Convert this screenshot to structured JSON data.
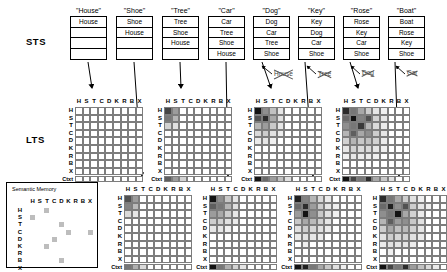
{
  "figure": {
    "sts_label": "STS",
    "lts_label": "LTS",
    "semantic_memory_title": "Semantic Memory",
    "context_row_label": "Ctxt",
    "item_labels": [
      "H",
      "S",
      "T",
      "C",
      "D",
      "K",
      "R",
      "B",
      "X"
    ]
  },
  "sts_columns": [
    {
      "cue": "\"House\"",
      "items": [
        "House",
        "",
        "",
        ""
      ]
    },
    {
      "cue": "\"Shoe\"",
      "items": [
        "Shoe",
        "House",
        "",
        ""
      ]
    },
    {
      "cue": "\"Tree\"",
      "items": [
        "Tree",
        "Shoe",
        "House",
        ""
      ]
    },
    {
      "cue": "\"Car\"",
      "items": [
        "Car",
        "Tree",
        "Shoe",
        "House"
      ]
    },
    {
      "cue": "\"Dog\"",
      "items": [
        "Dog",
        "Car",
        "Tree",
        "Shoe"
      ]
    },
    {
      "cue": "\"Key\"",
      "items": [
        "Key",
        "Dog",
        "Car",
        "Shoe"
      ]
    },
    {
      "cue": "\"Rose\"",
      "items": [
        "Rose",
        "Key",
        "Car",
        "Shoe"
      ]
    },
    {
      "cue": "\"Boat\"",
      "items": [
        "Boat",
        "Rose",
        "Key",
        "Shoe"
      ]
    }
  ],
  "dropped_words": [
    {
      "text": "House"
    },
    {
      "text": "Tree"
    },
    {
      "text": "Dog"
    },
    {
      "text": "Car"
    }
  ],
  "chart_data": {
    "type": "heatmap",
    "xlabel": "",
    "ylabel": "",
    "categories": [
      "H",
      "S",
      "T",
      "C",
      "D",
      "K",
      "R",
      "B",
      "X"
    ],
    "row_categories": [
      "H",
      "S",
      "T",
      "C",
      "D",
      "K",
      "R",
      "B",
      "X",
      "Ctxt"
    ],
    "scale": "0 = white (no association) to 1 = black (strong association)",
    "grid": true,
    "legend": "none",
    "matrices": [
      {
        "name": "lts-matrix-1",
        "source_trial": "\"House\"",
        "position": "top-row-1",
        "values": [
          [
            0,
            0,
            0,
            0,
            0,
            0,
            0,
            0,
            0
          ],
          [
            0,
            0,
            0,
            0,
            0,
            0,
            0,
            0,
            0
          ],
          [
            0,
            0,
            0,
            0,
            0,
            0,
            0,
            0,
            0
          ],
          [
            0,
            0,
            0,
            0,
            0,
            0,
            0,
            0,
            0
          ],
          [
            0,
            0,
            0,
            0,
            0,
            0,
            0,
            0,
            0
          ],
          [
            0,
            0,
            0,
            0,
            0,
            0,
            0,
            0,
            0
          ],
          [
            0,
            0,
            0,
            0,
            0,
            0,
            0,
            0,
            0
          ],
          [
            0,
            0,
            0,
            0,
            0,
            0,
            0,
            0,
            0
          ],
          [
            0,
            0,
            0,
            0,
            0,
            0,
            0,
            0,
            0
          ]
        ],
        "context": [
          0,
          0,
          0,
          0,
          0,
          0,
          0,
          0,
          0
        ]
      },
      {
        "name": "lts-matrix-2",
        "source_trial": "\"Tree\"",
        "position": "top-row-2",
        "values": [
          [
            0.75,
            0.4,
            0,
            0,
            0,
            0,
            0,
            0,
            0
          ],
          [
            0.55,
            0.3,
            0,
            0,
            0,
            0,
            0,
            0,
            0
          ],
          [
            0.18,
            0.12,
            0,
            0,
            0,
            0,
            0,
            0,
            0
          ],
          [
            0,
            0,
            0,
            0,
            0,
            0,
            0,
            0,
            0
          ],
          [
            0,
            0,
            0,
            0,
            0,
            0,
            0,
            0,
            0
          ],
          [
            0,
            0,
            0,
            0,
            0,
            0,
            0,
            0,
            0
          ],
          [
            0,
            0,
            0,
            0,
            0,
            0,
            0,
            0,
            0
          ],
          [
            0,
            0,
            0,
            0,
            0,
            0,
            0,
            0,
            0
          ],
          [
            0,
            0,
            0,
            0,
            0,
            0,
            0,
            0,
            0
          ]
        ],
        "context": [
          0.65,
          0.4,
          0.18,
          0,
          0,
          0,
          0,
          0,
          0
        ]
      },
      {
        "name": "lts-matrix-3",
        "source_trial": "\"Dog\"",
        "position": "top-row-3",
        "values": [
          [
            0.95,
            0.45,
            0.25,
            0.1,
            0,
            0,
            0,
            0,
            0
          ],
          [
            0.7,
            0.85,
            0.35,
            0.12,
            0,
            0,
            0,
            0,
            0
          ],
          [
            0.3,
            0.4,
            0.22,
            0.1,
            0,
            0,
            0,
            0,
            0
          ],
          [
            0.15,
            0.2,
            0.12,
            0.08,
            0,
            0,
            0,
            0,
            0
          ],
          [
            0.08,
            0.1,
            0.06,
            0,
            0,
            0,
            0,
            0,
            0
          ],
          [
            0,
            0,
            0,
            0,
            0,
            0,
            0,
            0,
            0
          ],
          [
            0,
            0,
            0,
            0,
            0,
            0,
            0,
            0,
            0
          ],
          [
            0,
            0,
            0,
            0,
            0,
            0,
            0,
            0,
            0
          ],
          [
            0,
            0,
            0,
            0,
            0,
            0,
            0,
            0,
            0
          ]
        ],
        "context": [
          0.95,
          0.6,
          0.4,
          0.25,
          0.12,
          0,
          0,
          0,
          0
        ]
      },
      {
        "name": "lts-matrix-4",
        "source_trial": "\"Rose\"",
        "position": "top-row-4",
        "values": [
          [
            0.85,
            0.55,
            0.35,
            0.2,
            0.1,
            0.06,
            0,
            0,
            0
          ],
          [
            0.6,
            0.95,
            0.5,
            0.7,
            0.18,
            0.1,
            0,
            0,
            0
          ],
          [
            0.45,
            0.55,
            0.8,
            0.3,
            0.15,
            0.08,
            0,
            0,
            0
          ],
          [
            0.3,
            0.65,
            0.35,
            0.45,
            0.2,
            0.1,
            0,
            0,
            0
          ],
          [
            0.18,
            0.3,
            0.22,
            0.25,
            0.18,
            0.08,
            0,
            0,
            0
          ],
          [
            0.1,
            0.18,
            0.14,
            0.15,
            0.1,
            0.06,
            0,
            0,
            0
          ],
          [
            0.06,
            0.1,
            0.08,
            0.08,
            0.06,
            0,
            0,
            0,
            0
          ],
          [
            0,
            0,
            0,
            0,
            0,
            0,
            0,
            0,
            0
          ],
          [
            0,
            0,
            0,
            0,
            0,
            0,
            0,
            0,
            0
          ]
        ],
        "context": [
          0.95,
          0.75,
          0.55,
          0.85,
          0.35,
          0.22,
          0.12,
          0,
          0
        ]
      },
      {
        "name": "lts-matrix-5",
        "source_trial": "\"Shoe\"",
        "position": "bottom-row-1",
        "values": [
          [
            0.7,
            0.4,
            0,
            0,
            0,
            0,
            0,
            0,
            0
          ],
          [
            0.5,
            0.28,
            0,
            0,
            0,
            0,
            0,
            0,
            0
          ],
          [
            0.15,
            0.1,
            0,
            0,
            0,
            0,
            0,
            0,
            0
          ],
          [
            0,
            0,
            0,
            0,
            0,
            0,
            0,
            0,
            0
          ],
          [
            0,
            0,
            0,
            0,
            0,
            0,
            0,
            0,
            0
          ],
          [
            0,
            0,
            0,
            0,
            0,
            0,
            0,
            0,
            0
          ],
          [
            0,
            0,
            0,
            0,
            0,
            0,
            0,
            0,
            0
          ],
          [
            0,
            0,
            0,
            0,
            0,
            0,
            0,
            0,
            0
          ],
          [
            0,
            0,
            0,
            0,
            0,
            0,
            0,
            0,
            0
          ]
        ],
        "context": [
          0.55,
          0.32,
          0.15,
          0,
          0,
          0,
          0,
          0,
          0
        ]
      },
      {
        "name": "lts-matrix-6",
        "source_trial": "\"Car\"",
        "position": "bottom-row-2",
        "values": [
          [
            0.95,
            0.45,
            0.22,
            0.1,
            0,
            0,
            0,
            0,
            0
          ],
          [
            0.65,
            0.55,
            0.3,
            0.12,
            0,
            0,
            0,
            0,
            0
          ],
          [
            0.4,
            0.35,
            0.2,
            0.1,
            0,
            0,
            0,
            0,
            0
          ],
          [
            0.2,
            0.18,
            0.12,
            0.08,
            0,
            0,
            0,
            0,
            0
          ],
          [
            0.1,
            0.1,
            0.06,
            0,
            0,
            0,
            0,
            0,
            0
          ],
          [
            0,
            0,
            0,
            0,
            0,
            0,
            0,
            0,
            0
          ],
          [
            0,
            0,
            0,
            0,
            0,
            0,
            0,
            0,
            0
          ],
          [
            0,
            0,
            0,
            0,
            0,
            0,
            0,
            0,
            0
          ],
          [
            0,
            0,
            0,
            0,
            0,
            0,
            0,
            0,
            0
          ]
        ],
        "context": [
          0.95,
          0.55,
          0.32,
          0.18,
          0.1,
          0,
          0,
          0,
          0
        ]
      },
      {
        "name": "lts-matrix-7",
        "source_trial": "\"Key\"",
        "position": "bottom-row-3",
        "values": [
          [
            0.9,
            0.5,
            0.3,
            0.15,
            0.08,
            0,
            0,
            0,
            0
          ],
          [
            0.6,
            0.85,
            0.4,
            0.2,
            0.1,
            0.06,
            0,
            0,
            0
          ],
          [
            0.4,
            0.95,
            0.45,
            0.22,
            0.12,
            0.06,
            0,
            0,
            0
          ],
          [
            0.22,
            0.35,
            0.28,
            0.18,
            0.1,
            0,
            0,
            0,
            0
          ],
          [
            0.12,
            0.2,
            0.16,
            0.12,
            0.08,
            0,
            0,
            0,
            0
          ],
          [
            0.08,
            0.12,
            0.1,
            0.08,
            0,
            0,
            0,
            0,
            0
          ],
          [
            0,
            0.06,
            0,
            0,
            0,
            0,
            0,
            0,
            0
          ],
          [
            0,
            0,
            0,
            0,
            0,
            0,
            0,
            0,
            0
          ],
          [
            0,
            0,
            0,
            0,
            0,
            0,
            0,
            0,
            0
          ]
        ],
        "context": [
          0.95,
          0.9,
          0.55,
          0.35,
          0.22,
          0.12,
          0.06,
          0,
          0
        ]
      },
      {
        "name": "lts-matrix-8",
        "source_trial": "\"Boat\"",
        "position": "bottom-row-4",
        "values": [
          [
            0.85,
            0.55,
            0.35,
            0.2,
            0.12,
            0.06,
            0,
            0,
            0
          ],
          [
            0.6,
            0.9,
            0.45,
            0.7,
            0.2,
            0.1,
            0.06,
            0,
            0
          ],
          [
            0.45,
            0.55,
            0.95,
            0.35,
            0.18,
            0.08,
            0,
            0,
            0
          ],
          [
            0.3,
            0.65,
            0.4,
            0.45,
            0.22,
            0.12,
            0,
            0,
            0
          ],
          [
            0.2,
            0.35,
            0.25,
            0.28,
            0.18,
            0.1,
            0,
            0,
            0
          ],
          [
            0.12,
            0.2,
            0.16,
            0.18,
            0.12,
            0.08,
            0,
            0,
            0
          ],
          [
            0.08,
            0.12,
            0.1,
            0.1,
            0.08,
            0,
            0,
            0,
            0
          ],
          [
            0,
            0.06,
            0,
            0,
            0,
            0,
            0,
            0,
            0
          ],
          [
            0,
            0,
            0,
            0,
            0,
            0,
            0,
            0,
            0
          ]
        ],
        "context": [
          0.95,
          0.75,
          0.55,
          0.85,
          0.4,
          0.25,
          0.15,
          0.08,
          0
        ]
      }
    ],
    "semantic_memory": {
      "name": "semantic-memory-matrix",
      "categories": [
        "H",
        "S",
        "T",
        "C",
        "D",
        "K",
        "R",
        "B",
        "X"
      ],
      "row_categories": [
        "H",
        "S",
        "T",
        "C",
        "D",
        "K",
        "R",
        "B",
        "X"
      ],
      "points": [
        {
          "row": 0,
          "col": 2,
          "value": 0.3
        },
        {
          "row": 1,
          "col": 0,
          "value": 0.3
        },
        {
          "row": 2,
          "col": 4,
          "value": 0.3
        },
        {
          "row": 3,
          "col": 5,
          "value": 0.3
        },
        {
          "row": 3,
          "col": 8,
          "value": 0.3
        },
        {
          "row": 4,
          "col": 3,
          "value": 0.3
        },
        {
          "row": 5,
          "col": 2,
          "value": 0.3
        },
        {
          "row": 7,
          "col": 4,
          "value": 0.3
        }
      ]
    }
  }
}
